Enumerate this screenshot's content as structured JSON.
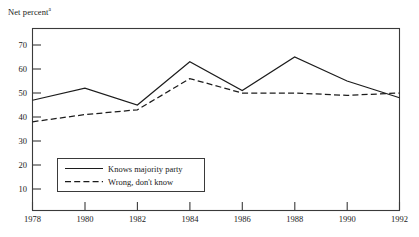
{
  "chart_data": {
    "type": "line",
    "title": "Net percent",
    "title_superscript": "a",
    "xlabel": "",
    "ylabel": "Net percent",
    "x": [
      1978,
      1980,
      1982,
      1984,
      1986,
      1988,
      1990,
      1992
    ],
    "xtick_labels": [
      "1978",
      "1980",
      "1982",
      "1984",
      "1986",
      "1988",
      "1990",
      "1992"
    ],
    "ytick_labels": [
      "10",
      "20",
      "30",
      "40",
      "50",
      "60",
      "70"
    ],
    "yticks": [
      10,
      20,
      30,
      40,
      50,
      60,
      70
    ],
    "ylim": [
      0,
      77
    ],
    "xlim": [
      1978,
      1992
    ],
    "grid": false,
    "legend_position": "lower left inside",
    "series": [
      {
        "name": "Knows majority party",
        "style": "solid",
        "values": [
          47,
          52,
          45,
          63,
          51,
          65,
          55,
          48
        ]
      },
      {
        "name": "Wrong, don't know",
        "style": "dashed",
        "values": [
          38,
          41,
          43,
          56,
          50,
          50,
          49,
          50
        ]
      }
    ]
  },
  "legend": {
    "items": [
      {
        "label": "Knows majority party",
        "style": "solid"
      },
      {
        "label": "Wrong, don't know",
        "style": "dashed"
      }
    ]
  }
}
